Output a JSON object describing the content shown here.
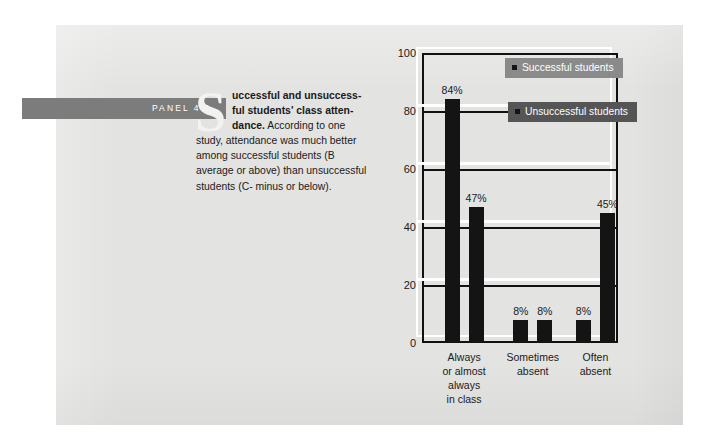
{
  "panel": {
    "label": "PANEL 4.1"
  },
  "caption": {
    "dropcap": "S",
    "bold_lead": "uccessful and unsuccessful students' class attendance.",
    "line1_bold": "uccessful and unsuccess-",
    "line2_bold": "ful students' class atten-",
    "line3_bold": "dance.",
    "body": " According to one study, attendance was much better among successful students (B average or above) than unsuccessful students (C- minus or below)."
  },
  "chart_data": {
    "type": "bar",
    "title": "",
    "xlabel": "",
    "ylabel": "",
    "ylim": [
      0,
      100
    ],
    "yticks": [
      0,
      20,
      40,
      60,
      80,
      100
    ],
    "ytick_labels": [
      "0",
      "20",
      "40",
      "60",
      "80",
      "100"
    ],
    "grid": true,
    "legend_position": "top-right",
    "categories": [
      "Always\nor almost\nalways\nin class",
      "Sometimes\nabsent",
      "Often\nabsent"
    ],
    "category_labels": [
      [
        "Always",
        "or almost",
        "always",
        "in class"
      ],
      [
        "Sometimes",
        "absent"
      ],
      [
        "Often",
        "absent"
      ]
    ],
    "series": [
      {
        "name": "Successful students",
        "color": "#141414",
        "box_color": "#8a8a8a",
        "values": [
          84,
          8,
          8
        ],
        "value_labels": [
          "84%",
          "8%",
          "8%"
        ]
      },
      {
        "name": "Unsuccessful students",
        "color": "#141414",
        "box_color": "#555555",
        "values": [
          47,
          8,
          45
        ],
        "value_labels": [
          "47%",
          "8%",
          "45%"
        ]
      }
    ]
  },
  "legend": [
    {
      "label": "Successful students"
    },
    {
      "label": "Unsuccessful students"
    }
  ],
  "colors": {
    "page": "#e3e3e1",
    "panel_tab": "#7c7c7c",
    "bar": "#141414",
    "legend_light": "#8a8a8a",
    "legend_dark": "#555555",
    "gridline": "#111111",
    "ghost": "#ffffff"
  }
}
